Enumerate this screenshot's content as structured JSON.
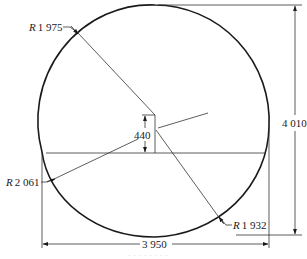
{
  "drawing": {
    "type": "technical-dimension-drawing",
    "colors": {
      "outline": "#1a1a1a",
      "dimension_line": "#333333",
      "background": "#ffffff",
      "caption": "#d8d8d8"
    },
    "radius_labels": [
      {
        "prefix": "R",
        "value": "1 975"
      },
      {
        "prefix": "R",
        "value": "2 061"
      },
      {
        "prefix": "R",
        "value": "1 932"
      }
    ],
    "dimensions": {
      "height": "4 010",
      "width": "3 950",
      "offset": "440"
    },
    "caption": "· · · · · · · ·"
  }
}
